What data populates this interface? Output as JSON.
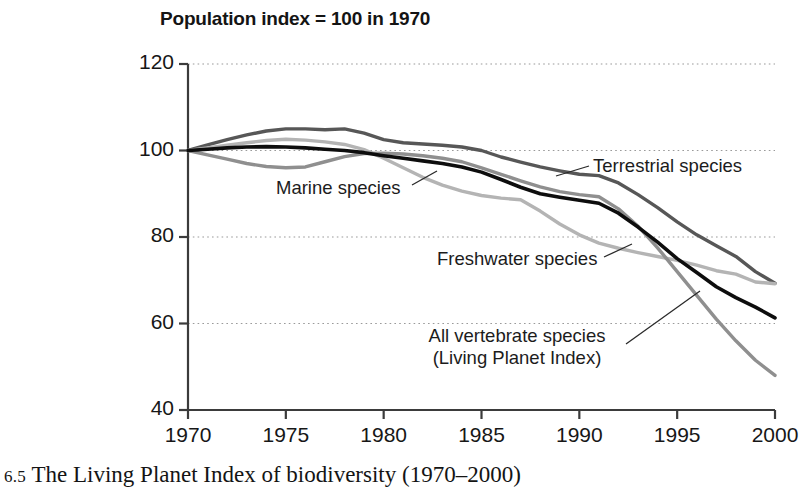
{
  "chart_data": {
    "type": "line",
    "title": "Population index = 100 in 1970",
    "xlabel": "",
    "ylabel": "",
    "xlim": [
      1970,
      2000
    ],
    "ylim": [
      40,
      120
    ],
    "xticks": [
      "1970",
      "1975",
      "1980",
      "1985",
      "1990",
      "1995",
      "2000"
    ],
    "yticks": [
      "40",
      "60",
      "80",
      "100",
      "120"
    ],
    "grid": "horizontal-dotted",
    "legend": "inline-annotations",
    "x": [
      1970,
      1971,
      1972,
      1973,
      1974,
      1975,
      1976,
      1977,
      1978,
      1979,
      1980,
      1981,
      1982,
      1983,
      1984,
      1985,
      1986,
      1987,
      1988,
      1989,
      1990,
      1991,
      1992,
      1993,
      1994,
      1995,
      1996,
      1997,
      1998,
      1999,
      2000
    ],
    "series": [
      {
        "name": "Terrestrial species",
        "color": "#575757",
        "values": [
          100,
          101.3,
          102.5,
          103.6,
          104.5,
          105,
          105,
          104.8,
          105,
          104,
          102.5,
          101.8,
          101.5,
          101.2,
          100.8,
          100,
          98.5,
          97.3,
          96.2,
          95.3,
          94.5,
          94.2,
          92.5,
          89.8,
          86.8,
          83.5,
          80.5,
          78,
          75.5,
          72,
          69.3
        ]
      },
      {
        "name": "Marine species",
        "color": "#8f8f8f",
        "values": [
          100,
          99,
          98,
          97,
          96.3,
          96,
          96.2,
          97.4,
          98.6,
          99.3,
          99.4,
          99.2,
          98.8,
          98.2,
          97.4,
          96,
          94.5,
          93,
          91.6,
          90.5,
          89.8,
          89.3,
          86.5,
          82.5,
          77.5,
          72,
          66.5,
          61,
          56,
          51.5,
          48
        ]
      },
      {
        "name": "Freshwater species",
        "color": "#b4b4b4",
        "values": [
          100,
          100.6,
          101.2,
          101.8,
          102.3,
          102.6,
          102.4,
          102,
          101.4,
          100.2,
          98.2,
          96,
          93.8,
          92,
          90.6,
          89.6,
          89,
          88.6,
          86,
          83,
          80.5,
          78.6,
          77.4,
          76.4,
          75.5,
          74.6,
          73.5,
          72.2,
          71.4,
          69.6,
          69.2
        ]
      },
      {
        "name": "All vertebrate species (Living Planet Index)",
        "color": "#0d0d0d",
        "values": [
          100,
          100.3,
          100.6,
          100.8,
          100.9,
          100.8,
          100.6,
          100.3,
          100,
          99.5,
          98.8,
          98.2,
          97.6,
          97,
          96.2,
          95,
          93.3,
          91.5,
          90,
          89.2,
          88.5,
          87.8,
          85.5,
          82.3,
          78.8,
          75,
          71.8,
          68.5,
          66,
          63.8,
          61.3
        ]
      }
    ],
    "annotations": [
      {
        "id": "terrestrial",
        "text": "Terrestrial species",
        "lines": [
          "Terrestrial species"
        ]
      },
      {
        "id": "marine",
        "text": "Marine species",
        "lines": [
          "Marine species"
        ]
      },
      {
        "id": "freshwater",
        "text": "Freshwater species",
        "lines": [
          "Freshwater species"
        ]
      },
      {
        "id": "all-vertebrate",
        "text": "All vertebrate species (Living Planet Index)",
        "lines": [
          "All vertebrate species",
          "(Living Planet Index)"
        ]
      }
    ]
  },
  "caption": {
    "number": "6.5",
    "text": "The Living Planet Index of biodiversity (1970–2000)"
  }
}
